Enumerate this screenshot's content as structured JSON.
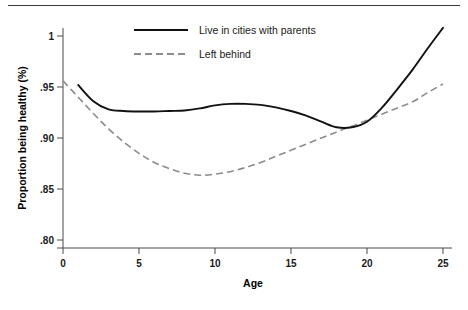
{
  "figure": {
    "has_top_rule": true,
    "background": "#ffffff"
  },
  "chart_data": {
    "type": "line",
    "title": "",
    "xlabel": "Age",
    "ylabel": "Proportion being healthy (%)",
    "xlim": [
      0,
      25
    ],
    "ylim": [
      0.8,
      1.0
    ],
    "xticks": [
      0,
      5,
      10,
      15,
      20,
      25
    ],
    "xtick_labels": [
      "0",
      "5",
      "10",
      "15",
      "20",
      "25"
    ],
    "yticks": [
      0.8,
      0.85,
      0.9,
      0.95,
      1.0
    ],
    "ytick_labels": [
      ".80",
      ".85",
      ".90",
      ".95",
      "1"
    ],
    "grid": false,
    "legend_position": "top-center",
    "series": [
      {
        "name": "Live in cities with parents",
        "style": "solid",
        "color": "#111111",
        "x": [
          1,
          2,
          3,
          4,
          5,
          6,
          7,
          8,
          9,
          10,
          11,
          12,
          13,
          14,
          15,
          16,
          17,
          18,
          19,
          20,
          21,
          22,
          23,
          24,
          25
        ],
        "y": [
          0.952,
          0.936,
          0.928,
          0.9265,
          0.926,
          0.926,
          0.9265,
          0.927,
          0.929,
          0.932,
          0.9335,
          0.9335,
          0.9325,
          0.93,
          0.9265,
          0.922,
          0.916,
          0.9105,
          0.9105,
          0.916,
          0.93,
          0.948,
          0.967,
          0.988,
          1.008
        ]
      },
      {
        "name": "Left behind",
        "style": "dashed",
        "color": "#8c8c8c",
        "x": [
          0,
          1,
          2,
          3,
          4,
          5,
          6,
          7,
          8,
          9,
          10,
          11,
          12,
          13,
          14,
          15,
          16,
          17,
          18,
          19,
          20,
          21,
          22,
          23,
          24,
          25
        ],
        "y": [
          0.956,
          0.94,
          0.924,
          0.909,
          0.896,
          0.885,
          0.876,
          0.87,
          0.8655,
          0.8635,
          0.8645,
          0.867,
          0.871,
          0.876,
          0.882,
          0.888,
          0.894,
          0.9,
          0.906,
          0.9115,
          0.9175,
          0.9235,
          0.9295,
          0.9355,
          0.9445,
          0.953
        ]
      }
    ],
    "annotations": []
  },
  "legend": {
    "entries": [
      {
        "label": "Live in cities with parents",
        "style": "solid"
      },
      {
        "label": "Left behind",
        "style": "dashed"
      }
    ]
  }
}
